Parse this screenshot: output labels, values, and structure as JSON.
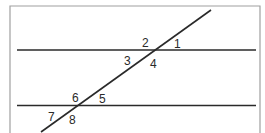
{
  "diagram": {
    "angle_labels": [
      "1",
      "2",
      "3",
      "4",
      "5",
      "6",
      "7",
      "8"
    ],
    "colors": {
      "line": "#2a2a2a",
      "frame": "#a0a0a0",
      "background": "#ffffff"
    }
  }
}
